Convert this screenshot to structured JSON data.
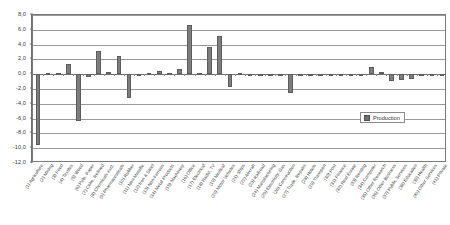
{
  "chart_data": {
    "type": "bar",
    "title": "",
    "xlabel": "",
    "ylabel": "",
    "ylim": [
      -12.0,
      8.0
    ],
    "ytick_step": 2.0,
    "grid": true,
    "decimal_separator": ",",
    "legend": {
      "position": "inside-bottom-right",
      "entries": [
        "Production"
      ]
    },
    "ytick_labels": [
      "8,0",
      "6,0",
      "4,0",
      "2,0",
      "0,0",
      "-2,0",
      "-4,0",
      "-6,0",
      "-8,0",
      "-10,0",
      "-12,0"
    ],
    "ytick_values": [
      8.0,
      6.0,
      4.0,
      2.0,
      0.0,
      -2.0,
      -4.0,
      -6.0,
      -8.0,
      -10.0,
      -12.0
    ],
    "series": [
      {
        "name": "Production",
        "color": "#7d7d7d",
        "values": [
          -9.6,
          0.1,
          0.15,
          1.4,
          -6.3,
          -0.4,
          3.2,
          0.25,
          2.4,
          -3.2,
          -0.1,
          0.1,
          0.4,
          0.15,
          0.7,
          6.6,
          0.2,
          3.7,
          5.1,
          -1.7,
          0.1,
          -0.1,
          -0.15,
          -0.2,
          -0.1,
          -2.5,
          -0.2,
          -0.2,
          -0.3,
          -0.2,
          -0.25,
          -0.2,
          -0.3,
          1.0,
          0.3,
          -0.9,
          -0.8,
          -0.6,
          -0.1,
          -0.15,
          -0.1
        ]
      }
    ],
    "categories": [
      "(1) Agriculture",
      "(2) Mining",
      "(3) Food",
      "(4) Textiles",
      "(5) Wood",
      "(6) Pulp, Paper",
      "(7) Coke, Refined",
      "(8) Chemicals excl.",
      "(9) Pharmaceuticals",
      "(10) Rubber",
      "(11) Non-Metallic",
      "(12) Iron & Steel",
      "(13) Non-Ferrous",
      "(14) Metal Products",
      "(15) Machinery",
      "(16) Office",
      "(17) Electrical",
      "(18) Radio, TV",
      "(19) Medical",
      "(20) Motor Vehicles",
      "(21) Ships",
      "(22) Aircraft",
      "(23) Railroad",
      "(24) Manufacturing",
      "(25) Electricity, Gas",
      "(26) Construction",
      "(27) Trade, Repairs",
      "(28) Hotels",
      "(29) Transport",
      "(30) Post",
      "(31) Finance",
      "(32) Real Estate",
      "(33) Renting",
      "(34) Computer",
      "(35) Other Research",
      "(36) Other Business",
      "(37) Public Services",
      "(38) Education",
      "(39) Health",
      "(40) Other Services",
      "(41) Private"
    ]
  }
}
